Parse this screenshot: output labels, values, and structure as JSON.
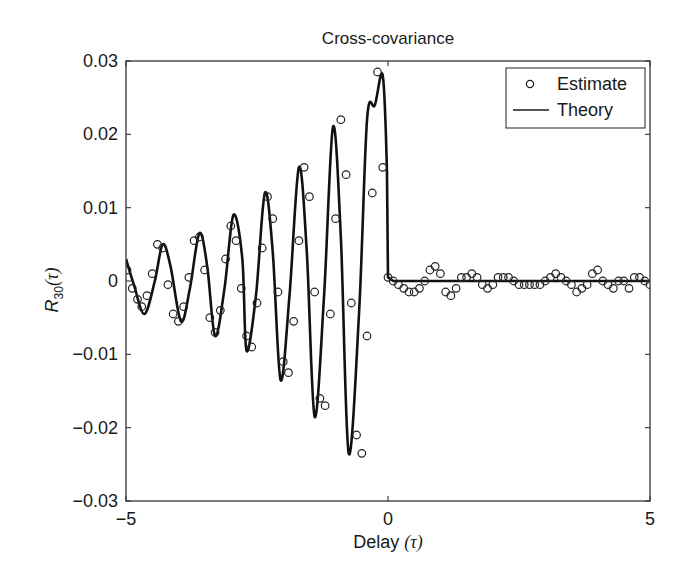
{
  "chart_data": {
    "type": "line",
    "title": "Cross-covariance",
    "xlabel": "Delay (τ)",
    "ylabel": "R30(τ)",
    "ylabel_parts": {
      "base": "R",
      "sub": "30",
      "arg": "(τ)"
    },
    "xlabel_parts": {
      "text": "Delay ",
      "arg": "(τ)"
    },
    "xlim": [
      -5,
      5
    ],
    "ylim": [
      -0.03,
      0.03
    ],
    "xticks": [
      -5,
      0,
      5
    ],
    "xtick_labels": [
      "−5",
      "0",
      "5"
    ],
    "yticks": [
      -0.03,
      -0.02,
      -0.01,
      0,
      0.01,
      0.02,
      0.03
    ],
    "ytick_labels": [
      "−0.03",
      "−0.02",
      "−0.01",
      "0",
      "0.01",
      "0.02",
      "0.03"
    ],
    "grid": false,
    "legend_position": "upper right",
    "legend": [
      {
        "label": "Estimate",
        "marker": "circle"
      },
      {
        "label": "Theory",
        "marker": "line"
      }
    ],
    "series": [
      {
        "name": "Theory",
        "style": "line",
        "x": [
          -5.0,
          -4.85,
          -4.65,
          -4.45,
          -4.3,
          -4.15,
          -3.95,
          -3.78,
          -3.6,
          -3.45,
          -3.3,
          -3.12,
          -2.95,
          -2.78,
          -2.7,
          -2.52,
          -2.35,
          -2.2,
          -2.05,
          -1.88,
          -1.7,
          -1.55,
          -1.4,
          -1.22,
          -1.05,
          -0.9,
          -0.75,
          -0.55,
          -0.4,
          -0.25,
          -0.1,
          -0.02,
          0.0,
          0.1,
          5.0
        ],
        "values": [
          0.003,
          -0.0005,
          -0.0045,
          0.0,
          0.005,
          0.002,
          -0.0055,
          -0.001,
          0.0065,
          0.002,
          -0.0075,
          -0.001,
          0.009,
          0.003,
          -0.0095,
          -0.002,
          0.012,
          0.004,
          -0.0135,
          -0.002,
          0.0155,
          0.004,
          -0.0185,
          -0.002,
          0.021,
          0.006,
          -0.0235,
          -0.004,
          0.022,
          0.024,
          0.028,
          0.015,
          0.0005,
          0.0,
          0.0
        ]
      },
      {
        "name": "Estimate",
        "style": "marker",
        "x": [
          -4.98,
          -4.88,
          -4.78,
          -4.7,
          -4.6,
          -4.5,
          -4.4,
          -4.3,
          -4.2,
          -4.1,
          -4.0,
          -3.9,
          -3.8,
          -3.7,
          -3.6,
          -3.5,
          -3.4,
          -3.3,
          -3.2,
          -3.1,
          -3.0,
          -2.9,
          -2.8,
          -2.7,
          -2.6,
          -2.5,
          -2.4,
          -2.3,
          -2.2,
          -2.1,
          -2.0,
          -1.9,
          -1.8,
          -1.7,
          -1.6,
          -1.5,
          -1.4,
          -1.3,
          -1.2,
          -1.1,
          -1.0,
          -0.9,
          -0.8,
          -0.7,
          -0.6,
          -0.5,
          -0.4,
          -0.3,
          -0.2,
          -0.1,
          0.0,
          0.1,
          0.2,
          0.3,
          0.4,
          0.5,
          0.6,
          0.7,
          0.8,
          0.9,
          1.0,
          1.1,
          1.2,
          1.3,
          1.4,
          1.5,
          1.6,
          1.7,
          1.8,
          1.9,
          2.0,
          2.1,
          2.2,
          2.3,
          2.4,
          2.5,
          2.6,
          2.7,
          2.8,
          2.9,
          3.0,
          3.1,
          3.2,
          3.3,
          3.4,
          3.5,
          3.6,
          3.7,
          3.8,
          3.9,
          4.0,
          4.1,
          4.2,
          4.3,
          4.4,
          4.5,
          4.6,
          4.7,
          4.8,
          4.9,
          5.0
        ],
        "values": [
          0.0015,
          -0.001,
          -0.0025,
          -0.0035,
          -0.002,
          0.001,
          0.005,
          0.0045,
          -0.0005,
          -0.0045,
          -0.0055,
          -0.0035,
          0.0005,
          0.0055,
          0.006,
          0.0015,
          -0.005,
          -0.007,
          -0.004,
          0.003,
          0.0075,
          0.0055,
          -0.001,
          -0.0075,
          -0.009,
          -0.003,
          0.0045,
          0.0115,
          0.0085,
          -0.0015,
          -0.011,
          -0.0125,
          -0.0055,
          0.0055,
          0.0155,
          0.0115,
          -0.0015,
          -0.016,
          -0.017,
          -0.0045,
          0.0085,
          0.022,
          0.0145,
          -0.003,
          -0.021,
          -0.0235,
          -0.0075,
          0.012,
          0.0285,
          0.0155,
          0.0005,
          0.0,
          -0.0005,
          -0.001,
          -0.0015,
          -0.0015,
          -0.001,
          0.0,
          0.0015,
          0.002,
          0.001,
          -0.0015,
          -0.002,
          -0.001,
          0.0005,
          0.0005,
          0.001,
          0.0005,
          -0.0005,
          -0.001,
          -0.0005,
          0.0005,
          0.0005,
          0.0005,
          0.0,
          -0.0005,
          -0.0005,
          -0.0005,
          -0.0005,
          -0.0005,
          0.0,
          0.0005,
          0.001,
          0.0005,
          0.0,
          -0.0005,
          -0.0015,
          -0.001,
          -0.0005,
          0.001,
          0.0015,
          0.0,
          -0.0005,
          -0.001,
          0.0,
          0.0,
          -0.001,
          0.0005,
          0.0005,
          0.0,
          -0.0005
        ]
      }
    ]
  },
  "plot_area": {
    "left": 126,
    "right": 650,
    "top": 61,
    "bottom": 501
  }
}
